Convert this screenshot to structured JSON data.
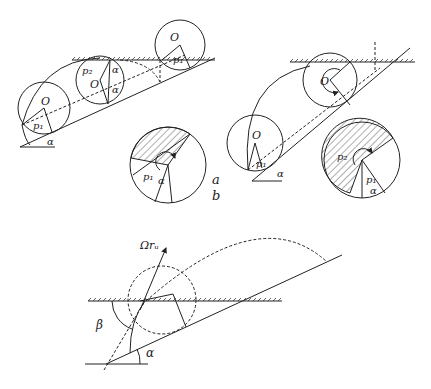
{
  "figure": {
    "panel_a": {
      "label": "a",
      "labels": {
        "center": "O",
        "p1": "p₁",
        "p2": "p₂",
        "alpha": "α"
      }
    },
    "panel_b": {
      "label": "b",
      "labels": {
        "center": "O",
        "p1": "p₁",
        "p2": "p₂",
        "alpha": "α"
      }
    },
    "panel_c": {
      "labels": {
        "velocity": "Ωrᵤ",
        "beta": "β",
        "alpha": "α"
      }
    }
  }
}
